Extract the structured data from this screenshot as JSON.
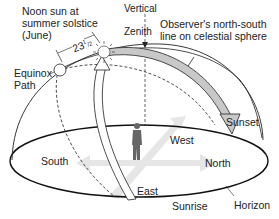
{
  "labels": {
    "noon_sun_line1": "Noon sun at",
    "noon_sun_line2": "summer solstice",
    "noon_sun_line3": "(June)",
    "angle_whole": "23",
    "angle_num": "1",
    "angle_den": "2",
    "equinox_line1": "Equinox",
    "equinox_line2": "Path",
    "vertical": "Vertical",
    "zenith": "Zenith",
    "ns_line1": "Observer's north-south",
    "ns_line2": "line on celestial sphere",
    "sunset": "Sunset",
    "west": "West",
    "north": "North",
    "south": "South",
    "east": "East",
    "sunrise": "Sunrise",
    "horizon": "Horizon"
  },
  "colors": {
    "line": "#222222",
    "sun_path_fill": "#c8c8c8",
    "compass_arrow": "#e6e6e6",
    "observer": "#666666"
  }
}
